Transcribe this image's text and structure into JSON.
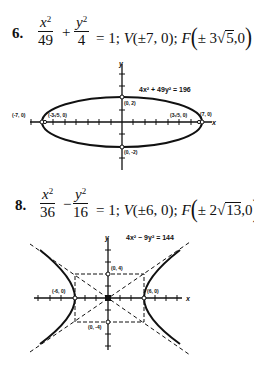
{
  "problems": [
    {
      "number": "6.",
      "fraction1": {
        "numerator": "x",
        "exp": "2",
        "denominator": "49"
      },
      "operator": "+",
      "fraction2": {
        "numerator": "y",
        "exp": "2",
        "denominator": "4"
      },
      "equals": "= 1;",
      "vertices": {
        "label": "V",
        "value": "(±7, 0);"
      },
      "foci": {
        "label": "F",
        "sign": "±",
        "coef": "3",
        "radicand": "5",
        "tail": ",0"
      },
      "graph": {
        "equation": "4x² + 49y² = 196",
        "axis_x": "x",
        "axis_y": "y",
        "points": {
          "left_vertex": "(-7, 0)",
          "right_vertex": "(7, 0)",
          "left_focus": "(-3√5, 0)",
          "right_focus": "(3√5, 0)",
          "top": "(0, 2)",
          "bottom": "(0, -2)"
        }
      }
    },
    {
      "number": "8.",
      "fraction1": {
        "numerator": "x",
        "exp": "2",
        "denominator": "36"
      },
      "operator": "−",
      "fraction2": {
        "numerator": "y",
        "exp": "2",
        "denominator": "16"
      },
      "equals": "= 1;",
      "vertices": {
        "label": "V",
        "value": "(±6, 0);"
      },
      "foci": {
        "label": "F",
        "sign": "±",
        "coef": "2",
        "radicand": "13",
        "tail": ",0"
      },
      "graph": {
        "equation": "4x² − 9y² = 144",
        "axis_x": "x",
        "axis_y": "y",
        "points": {
          "left_vertex": "(-6, 0)",
          "right_vertex": "(6, 0)",
          "top": "(0, 4)",
          "bottom": "(0, -4)"
        }
      }
    }
  ]
}
